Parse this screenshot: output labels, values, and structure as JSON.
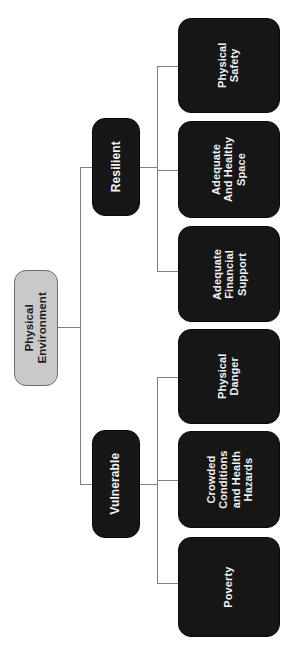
{
  "diagram": {
    "title": "Physical Environment",
    "orientation": "rotated-90-ccw",
    "colors": {
      "root_fill": "#c9c9c9",
      "root_text": "#1a1a1a",
      "node_fill": "#161616",
      "node_text": "#f2f2f2",
      "connector": "#808080",
      "background": "#ffffff"
    },
    "root": {
      "label": "Physical\nEnvironment"
    },
    "branches": [
      {
        "id": "resilient",
        "label": "Resilient",
        "children": [
          {
            "id": "physical-safety",
            "label": "Physical\nSafety"
          },
          {
            "id": "adequate-and-healthy-space",
            "label": "Adequate\nAnd Healthy\nSpace"
          },
          {
            "id": "adequate-financial-support",
            "label": "Adequate\nFinancial\nSupport"
          }
        ]
      },
      {
        "id": "vulnerable",
        "label": "Vulnerable",
        "children": [
          {
            "id": "physical-danger",
            "label": "Physical\nDanger"
          },
          {
            "id": "crowded-conditions-and-health-hazards",
            "label": "Crowded\nConditions\nand Health\nHazards"
          },
          {
            "id": "poverty",
            "label": "Poverty"
          }
        ]
      }
    ]
  }
}
